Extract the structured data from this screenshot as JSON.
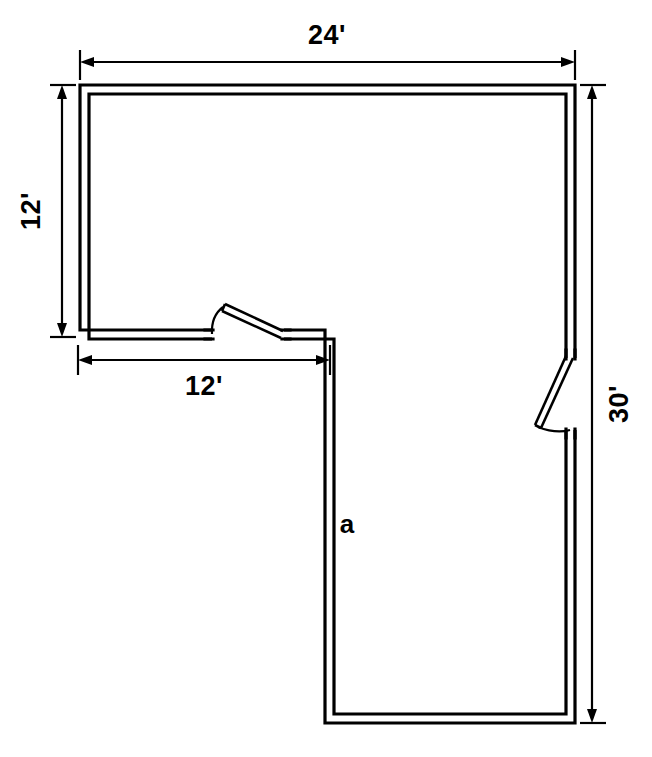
{
  "diagram": {
    "type": "architectural-floor-plan",
    "shape": "L-shaped",
    "background_color": "#ffffff",
    "line_color": "#000000"
  },
  "dimensions": {
    "top": {
      "label": "24'",
      "value": 24,
      "unit": "feet",
      "orientation": "horizontal",
      "edge": "top"
    },
    "left": {
      "label": "12'",
      "value": 12,
      "unit": "feet",
      "orientation": "vertical",
      "edge": "left"
    },
    "lower_left": {
      "label": "12'",
      "value": 12,
      "unit": "feet",
      "orientation": "horizontal",
      "edge": "interior-bottom"
    },
    "right": {
      "label": "30'",
      "value": 30,
      "unit": "feet",
      "orientation": "vertical",
      "edge": "right"
    }
  },
  "labels": {
    "unknown_side": "a"
  },
  "doors": [
    {
      "name": "interior-door",
      "location": "interior-bottom-wall",
      "swing": "up-left"
    },
    {
      "name": "exterior-door",
      "location": "right-wall",
      "swing": "down-left"
    }
  ]
}
